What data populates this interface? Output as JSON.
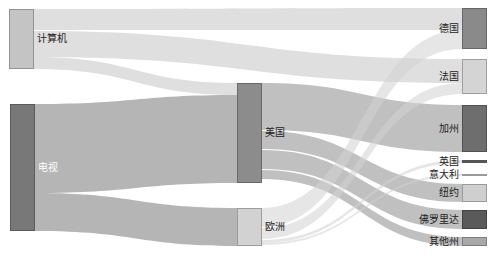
{
  "chart_data": {
    "type": "sankey",
    "title": "",
    "nodes": [
      {
        "id": "computer",
        "label": "计算机",
        "column": 0,
        "color": "#c4c4c4",
        "x": 9,
        "y0": 9,
        "y1": 69
      },
      {
        "id": "tv",
        "label": "电视",
        "column": 0,
        "color": "#787878",
        "x": 10,
        "y0": 104,
        "y1": 231
      },
      {
        "id": "usa",
        "label": "美国",
        "column": 1,
        "color": "#8c8c8c",
        "x": 237,
        "y0": 83,
        "y1": 183
      },
      {
        "id": "europe",
        "label": "欧洲",
        "column": 1,
        "color": "#d2d2d2",
        "x": 237,
        "y0": 208,
        "y1": 246
      },
      {
        "id": "germany",
        "label": "德国",
        "column": 2,
        "color": "#8a8a8a",
        "x": 462,
        "y0": 8,
        "y1": 49
      },
      {
        "id": "france",
        "label": "法国",
        "column": 2,
        "color": "#d4d4d4",
        "x": 462,
        "y0": 59,
        "y1": 94
      },
      {
        "id": "california",
        "label": "加州",
        "column": 2,
        "color": "#6e6e6e",
        "x": 462,
        "y0": 105,
        "y1": 152
      },
      {
        "id": "uk",
        "label": "英国",
        "column": 2,
        "color": "#555555",
        "x": 462,
        "y0": 160,
        "y1": 163
      },
      {
        "id": "italy",
        "label": "意大利",
        "column": 2,
        "color": "#999999",
        "x": 462,
        "y0": 174,
        "y1": 176
      },
      {
        "id": "newyork",
        "label": "纽约",
        "column": 2,
        "color": "#cfcfcf",
        "x": 462,
        "y0": 184,
        "y1": 202
      },
      {
        "id": "florida",
        "label": "佛罗里达",
        "column": 2,
        "color": "#5a5a5a",
        "x": 462,
        "y0": 210,
        "y1": 229
      },
      {
        "id": "otherstates",
        "label": "其他州",
        "column": 2,
        "color": "#a8a8a8",
        "x": 462,
        "y0": 237,
        "y1": 246
      }
    ],
    "links": [
      {
        "source": "computer",
        "target": "germany",
        "value": 22,
        "sy0": 9,
        "sy1": 30,
        "ty0": 8,
        "ty1": 30
      },
      {
        "source": "computer",
        "target": "france",
        "value": 25,
        "sy0": 31,
        "sy1": 57,
        "ty0": 59,
        "ty1": 83
      },
      {
        "source": "computer",
        "target": "usa",
        "value": 12,
        "sy0": 57,
        "sy1": 69,
        "ty0": 83,
        "ty1": 95
      },
      {
        "source": "tv",
        "target": "usa",
        "value": 88,
        "sy0": 104,
        "sy1": 193,
        "ty0": 95,
        "ty1": 183
      },
      {
        "source": "tv",
        "target": "europe",
        "value": 38,
        "sy0": 193,
        "sy1": 231,
        "ty0": 208,
        "ty1": 246
      },
      {
        "source": "usa",
        "target": "california",
        "value": 47,
        "sy0": 83,
        "sy1": 130,
        "ty0": 105,
        "ty1": 152
      },
      {
        "source": "usa",
        "target": "newyork",
        "value": 18,
        "sy0": 131,
        "sy1": 149,
        "ty0": 184,
        "ty1": 202
      },
      {
        "source": "usa",
        "target": "florida",
        "value": 19,
        "sy0": 150,
        "sy1": 169,
        "ty0": 210,
        "ty1": 229
      },
      {
        "source": "usa",
        "target": "otherstates",
        "value": 9,
        "sy0": 170,
        "sy1": 179,
        "ty0": 237,
        "ty1": 246
      },
      {
        "source": "europe",
        "target": "germany",
        "value": 19,
        "sy0": 208,
        "sy1": 227,
        "ty0": 30,
        "ty1": 49
      },
      {
        "source": "europe",
        "target": "france",
        "value": 11,
        "sy0": 228,
        "sy1": 239,
        "ty0": 83,
        "ty1": 94
      },
      {
        "source": "europe",
        "target": "uk",
        "value": 3,
        "sy0": 240,
        "sy1": 243,
        "ty0": 160,
        "ty1": 163
      },
      {
        "source": "europe",
        "target": "italy",
        "value": 2,
        "sy0": 243,
        "sy1": 245,
        "ty0": 174,
        "ty1": 176
      }
    ],
    "node_width": 25,
    "link_opacity": 0.55
  }
}
